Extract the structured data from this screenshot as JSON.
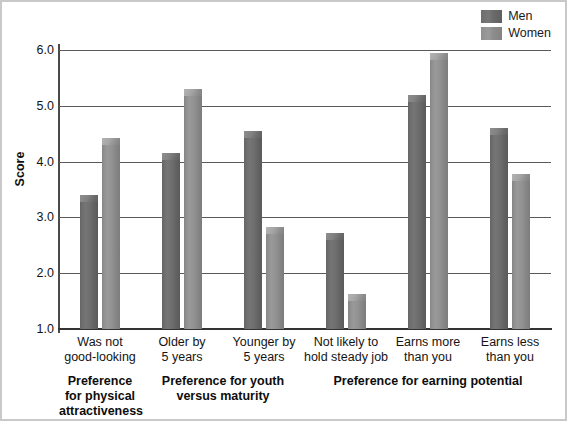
{
  "chart_data": {
    "type": "bar",
    "title": "",
    "xlabel": "",
    "ylabel": "Score",
    "ylim": [
      1.0,
      6.0
    ],
    "yticks": [
      "1.0",
      "2.0",
      "3.0",
      "4.0",
      "5.0",
      "6.0"
    ],
    "grid": true,
    "legend_position": "top-right",
    "categories": [
      "Was not good-looking",
      "Older by 5 years",
      "Younger by 5 years",
      "Not likely to hold steady job",
      "Earns more than you",
      "Earns less than you"
    ],
    "category_lines": [
      [
        "Was not",
        "good-looking"
      ],
      [
        "Older by",
        "5 years"
      ],
      [
        "Younger by",
        "5 years"
      ],
      [
        "Not likely to",
        "hold steady job"
      ],
      [
        "Earns more",
        "than you"
      ],
      [
        "Earns less",
        "than you"
      ]
    ],
    "series": [
      {
        "name": "Men",
        "color": "#6e6e6e",
        "values": [
          3.4,
          4.15,
          4.55,
          2.72,
          5.2,
          4.6
        ]
      },
      {
        "name": "Women",
        "color": "#919191",
        "values": [
          4.42,
          5.3,
          2.82,
          1.62,
          5.95,
          3.78
        ]
      }
    ],
    "groups": [
      {
        "label_lines": [
          "Preference",
          "for physical",
          "attractiveness"
        ],
        "categories": [
          0
        ]
      },
      {
        "label_lines": [
          "Preference for youth",
          "versus maturity"
        ],
        "categories": [
          1,
          2
        ]
      },
      {
        "label_lines": [
          "Preference for earning potential"
        ],
        "categories": [
          3,
          4,
          5
        ]
      }
    ]
  },
  "legend": {
    "items": [
      {
        "label": "Men",
        "swatch": "men"
      },
      {
        "label": "Women",
        "swatch": "women"
      }
    ]
  },
  "axis": {
    "y_title": "Score",
    "ticks": [
      {
        "value": "6.0"
      },
      {
        "value": "5.0"
      },
      {
        "value": "4.0"
      },
      {
        "value": "3.0"
      },
      {
        "value": "2.0"
      },
      {
        "value": "1.0"
      }
    ]
  }
}
